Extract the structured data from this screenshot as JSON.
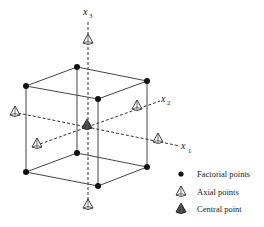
{
  "diagram": {
    "type": "central-composite-design",
    "axes": [
      {
        "id": "x1",
        "label": "x",
        "subscript": "1"
      },
      {
        "id": "x2",
        "label": "x",
        "subscript": "2"
      },
      {
        "id": "x3",
        "label": "x",
        "subscript": "3"
      }
    ],
    "legend": [
      {
        "marker": "filled-circle",
        "label": "Factorial points"
      },
      {
        "marker": "open-cone",
        "label": "Axial points"
      },
      {
        "marker": "filled-cone",
        "label": "Central point"
      }
    ],
    "colors": {
      "line": "#333333",
      "point": "#111111",
      "central": "#444444"
    }
  }
}
